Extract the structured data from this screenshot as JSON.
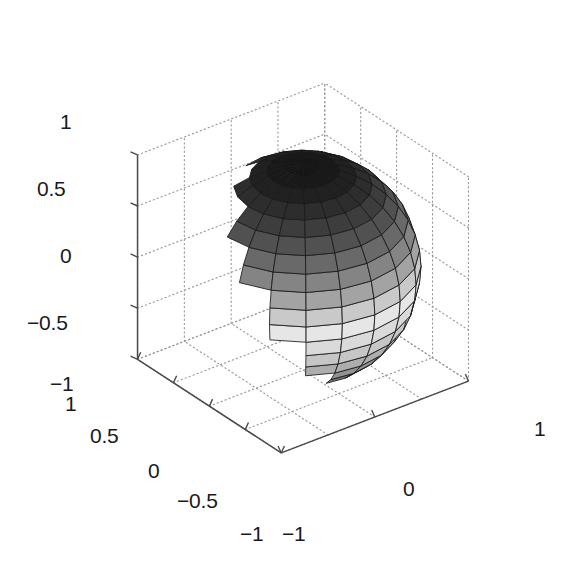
{
  "figure": {
    "type": "matlab-3d-surface-plot",
    "background_color": "#ffffff",
    "width": 562,
    "height": 565
  },
  "chart_data": {
    "type": "surface",
    "title": "",
    "subtitle": "",
    "xlabel": "",
    "ylabel": "",
    "zlabel": "",
    "surface": {
      "shape": "sphere",
      "radius": 1,
      "center": [
        0,
        0,
        0
      ],
      "mesh_meridians": 20,
      "mesh_parallels": 20,
      "colormap": "gray",
      "shading_variable": "z",
      "edge_color": "#1a1a1a",
      "face_color_light": "#e8e8e8",
      "face_color_dark": "#1e1e1e"
    },
    "view": {
      "azimuth": -37.5,
      "elevation": 30,
      "projection": "orthographic",
      "grid": true,
      "box": false
    },
    "axes": {
      "x": {
        "label": "",
        "lim": [
          -1,
          1
        ],
        "ticks": [
          -1,
          0,
          1
        ],
        "ticklabels": [
          "−1",
          "0",
          "1"
        ]
      },
      "y": {
        "label": "",
        "lim": [
          -1,
          1
        ],
        "ticks": [
          1,
          0.5,
          0,
          -0.5,
          -1
        ],
        "ticklabels": [
          "1",
          "0.5",
          "0",
          "−0.5",
          "−1"
        ]
      },
      "z": {
        "label": "",
        "lim": [
          -1,
          1
        ],
        "ticks": [
          1,
          0.5,
          0,
          -0.5,
          -1
        ],
        "ticklabels": [
          "1",
          "0.5",
          "0",
          "−0.5",
          "−1"
        ]
      }
    },
    "legend": null,
    "annotations": []
  },
  "ticks": {
    "z": [
      {
        "text": "1",
        "x": 60,
        "y": 111
      },
      {
        "text": "0.5",
        "x": 37,
        "y": 178
      },
      {
        "text": "0",
        "x": 60,
        "y": 245
      },
      {
        "text": "−0.5",
        "x": 27,
        "y": 312
      },
      {
        "text": "−1",
        "x": 50,
        "y": 373
      }
    ],
    "y": [
      {
        "text": "1",
        "x": 65,
        "y": 393
      },
      {
        "text": "0.5",
        "x": 90,
        "y": 425
      },
      {
        "text": "0",
        "x": 148,
        "y": 460
      },
      {
        "text": "−0.5",
        "x": 177,
        "y": 490
      },
      {
        "text": "−1",
        "x": 240,
        "y": 523
      }
    ],
    "x": [
      {
        "text": "−1",
        "x": 282,
        "y": 523
      },
      {
        "text": "0",
        "x": 403,
        "y": 478
      },
      {
        "text": "1",
        "x": 534,
        "y": 418
      }
    ]
  },
  "colors": {
    "axis_line": "#4a4a4a",
    "grid_dot": "#9a9a9a",
    "tick_text": "#1a1a1a",
    "background": "#ffffff"
  }
}
